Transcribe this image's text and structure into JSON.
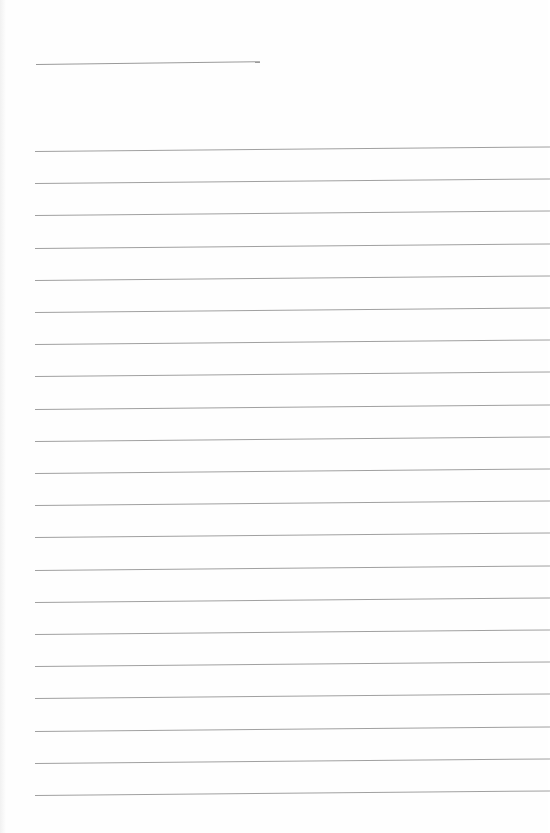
{
  "document": {
    "type": "lined-paper",
    "header_field": {
      "label": ""
    },
    "ruled_lines": {
      "count": 21,
      "first_y": 151,
      "spacing": 32.2,
      "color": "#a0a0a0"
    },
    "body_text": ""
  }
}
